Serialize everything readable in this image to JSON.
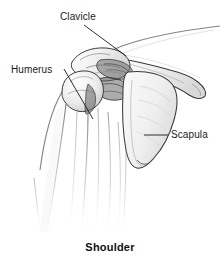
{
  "figure": {
    "caption": "Shoulder",
    "view": "anterior shoulder joint illustration",
    "background_color": "#ffffff",
    "ink_color": "#2b2b2b",
    "leader_line_color": "#1a1a1a",
    "label_text_color": "#1a1a1a",
    "labels": [
      {
        "id": "clavicle",
        "text": "Clavicle",
        "text_x": 60,
        "text_y": 11,
        "leader": {
          "x1": 84,
          "y1": 25,
          "x2": 126,
          "y2": 56
        }
      },
      {
        "id": "humerus",
        "text": "Humerus",
        "text_x": 11,
        "text_y": 64,
        "leader": {
          "x1": 64,
          "y1": 69,
          "x2": 93,
          "y2": 119
        }
      },
      {
        "id": "scapula",
        "text": "Scapula",
        "text_x": 171,
        "text_y": 129,
        "leader": {
          "x1": 144,
          "y1": 135,
          "x2": 168,
          "y2": 135
        }
      }
    ],
    "structures": [
      "clavicle",
      "acromion",
      "coracoid process",
      "humeral head",
      "humerus shaft",
      "glenohumeral joint",
      "scapula body",
      "deltoid contour"
    ]
  }
}
